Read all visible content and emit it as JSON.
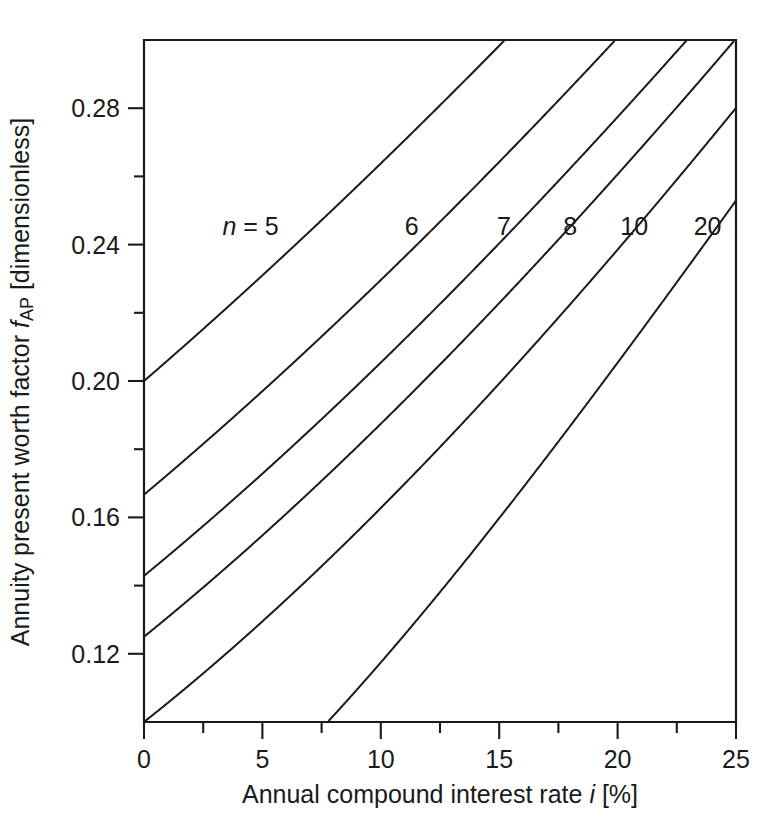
{
  "chart_data": {
    "type": "line",
    "title": "",
    "subtitle": "",
    "xlabel_text": "Annual compound interest rate i [%]",
    "xlabel_parts": {
      "pre": "Annual compound interest rate ",
      "sym": "i",
      "post": " [%]"
    },
    "ylabel_text": "Annuity present worth factor fAP [dimensionless]",
    "ylabel_parts": {
      "pre": "Annuity present worth factor ",
      "sym": "f",
      "sub": "AP",
      "post": " [dimensionless]"
    },
    "xlim": [
      0,
      25
    ],
    "ylim": [
      0.1,
      0.3
    ],
    "grid": false,
    "legend_position": "inline-curve-labels",
    "x_ticks_major": [
      0,
      5,
      10,
      15,
      20,
      25
    ],
    "x_tick_labels": [
      "0",
      "5",
      "10",
      "15",
      "20",
      "25"
    ],
    "x_ticks_minor": [
      2.5,
      7.5,
      12.5,
      17.5,
      22.5
    ],
    "y_ticks_major": [
      0.12,
      0.16,
      0.2,
      0.24,
      0.28
    ],
    "y_tick_labels": [
      "0.12",
      "0.16",
      "0.20",
      "0.24",
      "0.28"
    ],
    "y_ticks_minor": [
      0.1,
      0.14,
      0.18,
      0.22,
      0.26,
      0.3
    ],
    "formula": "f_AP = i / (1 - (1 + i)^-n)",
    "series": [
      {
        "name": "n = 5",
        "n": 5,
        "label": "n = 5",
        "label_italic_prefix": "n",
        "label_rest": " = 5",
        "label_x": 4.5,
        "label_y": 0.2455,
        "x": [
          0,
          1,
          2,
          3,
          4,
          5,
          6,
          7,
          8,
          9,
          10,
          11,
          12,
          13,
          14,
          15,
          16,
          17,
          18,
          19,
          20,
          21,
          22,
          23,
          24,
          25
        ],
        "y": [
          0.2,
          0.206,
          0.2122,
          0.2184,
          0.2246,
          0.231,
          0.2374,
          0.2439,
          0.2505,
          0.2571,
          0.2638,
          0.2706,
          0.2774,
          0.2843,
          0.2913,
          0.2983,
          0.3054,
          0.3126,
          0.3198,
          0.3271,
          0.3344,
          0.3418,
          0.3492,
          0.3567,
          0.3642,
          0.3718
        ]
      },
      {
        "name": "6",
        "n": 6,
        "label": "6",
        "label_x": 11.3,
        "label_y": 0.2455,
        "x": [
          0,
          1,
          2,
          3,
          4,
          5,
          6,
          7,
          8,
          9,
          10,
          11,
          12,
          13,
          14,
          15,
          16,
          17,
          18,
          19,
          20,
          21,
          22,
          23,
          24,
          25
        ],
        "y": [
          0.1667,
          0.1725,
          0.1785,
          0.1846,
          0.1908,
          0.197,
          0.2034,
          0.2098,
          0.2163,
          0.2229,
          0.2296,
          0.2364,
          0.2432,
          0.2501,
          0.2572,
          0.2642,
          0.2714,
          0.2786,
          0.2859,
          0.2932,
          0.3007,
          0.3082,
          0.3157,
          0.3233,
          0.331,
          0.3388
        ]
      },
      {
        "name": "7",
        "n": 7,
        "label": "7",
        "label_x": 15.2,
        "label_y": 0.2455,
        "x": [
          0,
          1,
          2,
          3,
          4,
          5,
          6,
          7,
          8,
          9,
          10,
          11,
          12,
          13,
          14,
          15,
          16,
          17,
          18,
          19,
          20,
          21,
          22,
          23,
          24,
          25
        ],
        "y": [
          0.1429,
          0.1486,
          0.1545,
          0.1605,
          0.1666,
          0.1728,
          0.1791,
          0.1856,
          0.1921,
          0.1987,
          0.2054,
          0.2122,
          0.2191,
          0.2261,
          0.2332,
          0.2404,
          0.2476,
          0.2549,
          0.2624,
          0.2698,
          0.2774,
          0.285,
          0.2927,
          0.3005,
          0.3083,
          0.3163
        ]
      },
      {
        "name": "8",
        "n": 8,
        "label": "8",
        "label_x": 18.0,
        "label_y": 0.2455,
        "x": [
          0,
          1,
          2,
          3,
          4,
          5,
          6,
          7,
          8,
          9,
          10,
          11,
          12,
          13,
          14,
          15,
          16,
          17,
          18,
          19,
          20,
          21,
          22,
          23,
          24,
          25
        ],
        "y": [
          0.125,
          0.1307,
          0.1365,
          0.1425,
          0.1485,
          0.1547,
          0.161,
          0.1675,
          0.174,
          0.1807,
          0.1874,
          0.1943,
          0.2013,
          0.2084,
          0.2156,
          0.2229,
          0.2302,
          0.2377,
          0.2452,
          0.2529,
          0.2606,
          0.2684,
          0.2762,
          0.2842,
          0.2922,
          0.3002
        ]
      },
      {
        "name": "10",
        "n": 10,
        "label": "10",
        "label_x": 20.7,
        "label_y": 0.2455,
        "x": [
          0,
          1,
          2,
          3,
          4,
          5,
          6,
          7,
          8,
          9,
          10,
          11,
          12,
          13,
          14,
          15,
          16,
          17,
          18,
          19,
          20,
          21,
          22,
          23,
          24,
          25
        ],
        "y": [
          0.1,
          0.1056,
          0.1113,
          0.1172,
          0.1233,
          0.1295,
          0.1359,
          0.1424,
          0.149,
          0.1558,
          0.1627,
          0.1698,
          0.177,
          0.1843,
          0.1917,
          0.1993,
          0.2069,
          0.2147,
          0.2225,
          0.2305,
          0.2385,
          0.2467,
          0.2549,
          0.2632,
          0.2716,
          0.2801
        ]
      },
      {
        "name": "20",
        "n": 20,
        "label": "20",
        "label_x": 23.8,
        "label_y": 0.2455,
        "x": [
          8,
          9,
          10,
          11,
          12,
          13,
          14,
          15,
          16,
          17,
          18,
          19,
          20,
          21,
          22,
          23,
          24,
          25
        ],
        "y": [
          0.1019,
          0.1095,
          0.1175,
          0.1256,
          0.1339,
          0.1424,
          0.151,
          0.1598,
          0.1687,
          0.1777,
          0.1867,
          0.1959,
          0.2051,
          0.2144,
          0.2237,
          0.2331,
          0.2426,
          0.2529
        ]
      }
    ]
  },
  "colors": {
    "line": "#1a1a1a",
    "background": "#ffffff",
    "axis": "#1a1a1a"
  }
}
